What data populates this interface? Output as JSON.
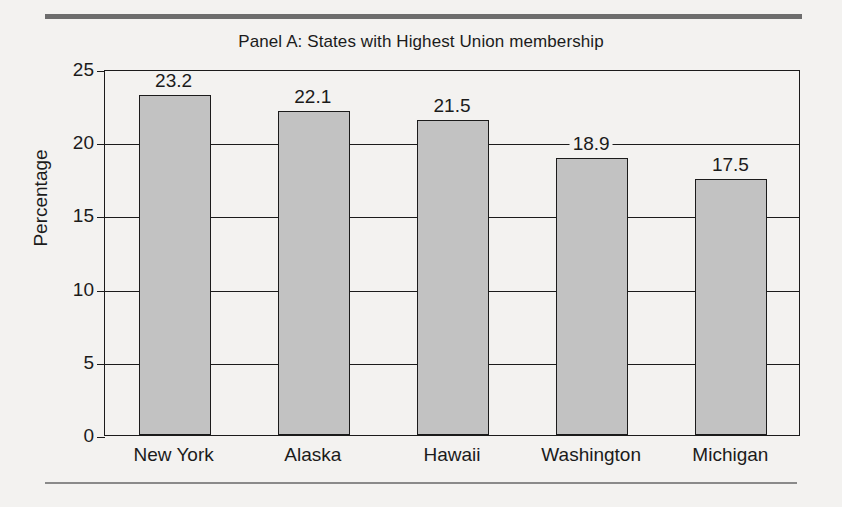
{
  "figure": {
    "title": "Panel A: States with Highest Union membership",
    "ylabel": "Percentage"
  },
  "chart_data": {
    "type": "bar",
    "title": "Panel A: States with Highest Union membership",
    "xlabel": "",
    "ylabel": "Percentage",
    "categories": [
      "New York",
      "Alaska",
      "Hawaii",
      "Washington",
      "Michigan"
    ],
    "values": [
      23.2,
      22.1,
      21.5,
      18.9,
      17.5
    ],
    "value_labels": [
      "23.2",
      "22.1",
      "21.5",
      "18.9",
      "17.5"
    ],
    "ylim": [
      0,
      25
    ],
    "yticks": [
      0,
      5,
      10,
      15,
      20,
      25
    ],
    "ytick_labels": [
      "0",
      "5",
      "10",
      "15",
      "20",
      "25"
    ],
    "grid": "horizontal",
    "legend": "none",
    "bar_fill_color": "#c2c2c2",
    "bar_edge_color": "#1b1b1b",
    "background_color": "#f3f2f0"
  }
}
